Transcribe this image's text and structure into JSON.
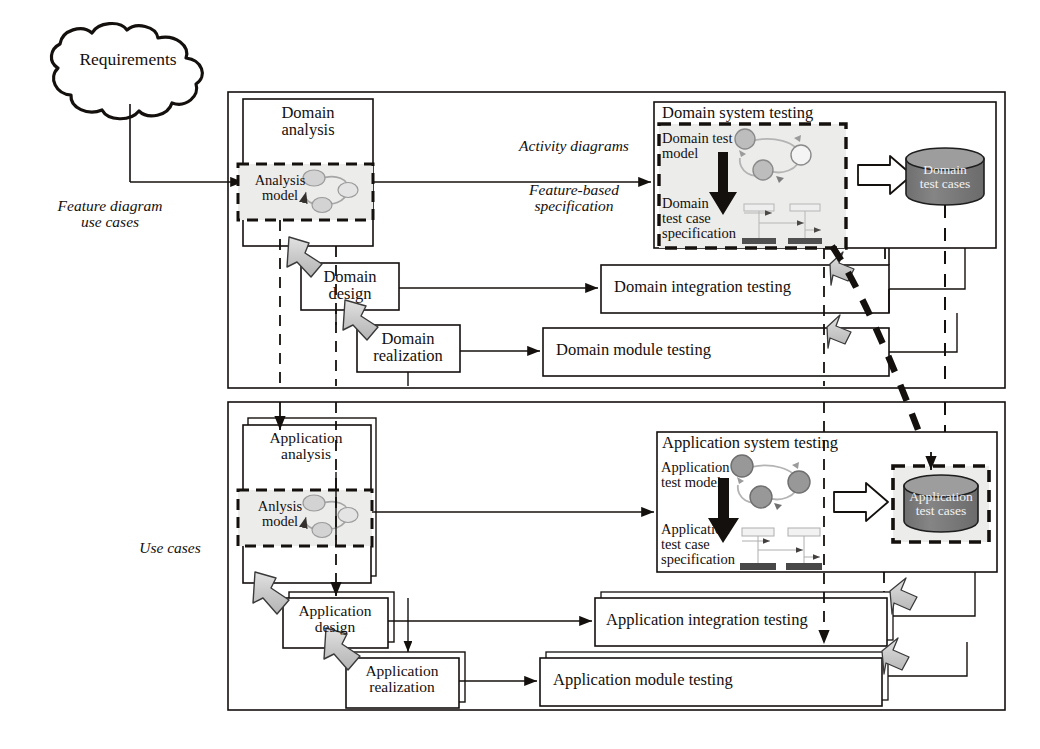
{
  "figure": {
    "cloud_label": "Requirements"
  },
  "annotations": {
    "feature_diagram_use_cases": "Feature diagram\nuse cases",
    "use_cases": "Use cases",
    "activity_diagrams": "Activity diagrams",
    "feature_based_specification": "Feature-based\nspecification"
  },
  "domain_panel": {
    "analysis_box": "Domain\nanalysis",
    "analysis_model": "Analysis\nmodel",
    "design_box": "Domain\ndesign",
    "realization_box": "Domain\nrealization",
    "system_testing_title": "Domain system testing",
    "test_model": "Domain test\nmodel",
    "test_case_specification": "Domain\ntest case\nspecification",
    "test_cases_store": "Domain\ntest cases",
    "integration_testing": "Domain integration testing",
    "module_testing": "Domain module testing"
  },
  "application_panel": {
    "analysis_box": "Application\nanalysis",
    "analysis_model": "Anlysis\nmodel",
    "design_box": "Application\ndesign",
    "realization_box": "Application\nrealization",
    "system_testing_title": "Application system testing",
    "test_model": "Application\ntest model",
    "test_case_specification": "Application\ntest case\nspecification",
    "test_cases_store": "Application\ntest cases",
    "integration_testing": "Application integration testing",
    "module_testing": "Application module testing"
  },
  "icons": {
    "cloud": "cloud-icon",
    "database_cylinder": "database-cylinder-icon",
    "block-arrow": "block-arrow-icon",
    "hollow-arrow": "hollow-arrow-icon",
    "activity-graph": "activity-graph-icon",
    "sequence-diagram": "sequence-diagram-icon",
    "down-arrow": "down-arrow-icon"
  },
  "colors": {
    "stroke": "#14100e",
    "model_fill": "#ececeb",
    "cylinder_fill": "#7e7e7e",
    "cylinder_top": "#9a9a9a",
    "block_arrow_fill": "#cfcfcf",
    "node_fill": "#bdbdbd",
    "background": "#ffffff"
  }
}
